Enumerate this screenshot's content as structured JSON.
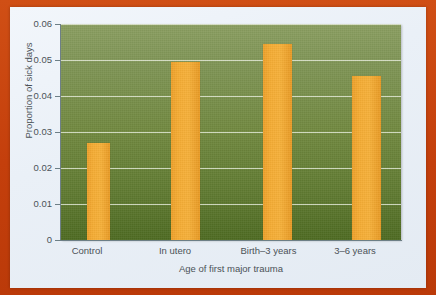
{
  "chart_data": {
    "type": "bar",
    "title": "",
    "xlabel": "Age of first major trauma",
    "ylabel": "Proportion of sick days",
    "categories": [
      "Control",
      "In utero",
      "Birth–3 years",
      "3–6 years"
    ],
    "values": [
      0.027,
      0.0495,
      0.0545,
      0.0455
    ],
    "ylim": [
      0,
      0.06
    ],
    "yticks": [
      0,
      0.01,
      0.02,
      0.03,
      0.04,
      0.05,
      0.06
    ],
    "ytick_labels": [
      "0",
      "0.01",
      "0.02",
      "0.03",
      "0.04",
      "0.05",
      "0.06"
    ],
    "grid": true,
    "grid_axis": "y",
    "legend": false,
    "legend_position": "none",
    "bar_color": "#f2a32e",
    "plot_background_top": "#8a9e60",
    "plot_background_bottom": "#4e6b22",
    "gridline_color": "#eef2e4",
    "axis_color": "#6d7f86",
    "text_color": "#4b5257",
    "page_background": "#e9eff6",
    "border_color": "#c6420f"
  }
}
